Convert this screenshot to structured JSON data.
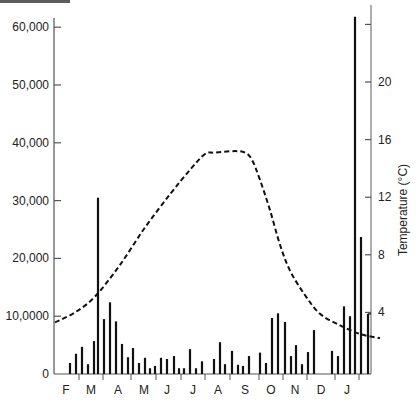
{
  "chart_data": {
    "type": "bar",
    "title": "",
    "xlabel": "",
    "ylabel": "",
    "y2label": "Temperature (°C)",
    "ylim": [
      0,
      65000
    ],
    "y2lim": [
      0,
      25
    ],
    "grid": false,
    "legend": null,
    "left_axis": {
      "ticks": [
        {
          "value": 0,
          "label": "0"
        },
        {
          "value": 10000,
          "label": "10,0000"
        },
        {
          "value": 20000,
          "label": "20,000"
        },
        {
          "value": 30000,
          "label": "30,000"
        },
        {
          "value": 40000,
          "label": "40,000"
        },
        {
          "value": 50000,
          "label": "50,000"
        },
        {
          "value": 60000,
          "label": "60,000"
        }
      ]
    },
    "right_axis": {
      "title": "Temperature (°C)",
      "ticks": [
        {
          "value": 4,
          "label": "4"
        },
        {
          "value": 8,
          "label": "8"
        },
        {
          "value": 12,
          "label": "12"
        },
        {
          "value": 16,
          "label": "16"
        },
        {
          "value": 20,
          "label": "20"
        },
        {
          "value": 24,
          "label": ""
        }
      ]
    },
    "months": [
      "F",
      "M",
      "A",
      "M",
      "J",
      "J",
      "A",
      "S",
      "O",
      "N",
      "D",
      "J"
    ],
    "series": [
      {
        "name": "Counts (bars)",
        "type": "bar",
        "x_px": [
          70,
          76,
          82,
          88,
          94,
          98,
          104,
          110,
          116,
          122,
          128,
          133,
          139,
          145,
          150,
          155,
          161,
          167,
          174,
          179,
          184,
          190,
          196,
          202,
          214,
          220,
          225,
          232,
          238,
          243,
          249,
          260,
          266,
          272,
          278,
          285,
          291,
          296,
          302,
          308,
          314,
          332,
          338,
          344,
          350,
          355,
          361,
          368
        ],
        "values": [
          1900,
          3500,
          4700,
          1700,
          5700,
          30500,
          9500,
          12400,
          9100,
          5200,
          2900,
          4500,
          1900,
          2800,
          1000,
          1400,
          2800,
          2600,
          3100,
          1000,
          1000,
          4300,
          1000,
          2200,
          2600,
          5500,
          1700,
          4000,
          1600,
          1400,
          3100,
          3700,
          1900,
          9700,
          10500,
          9000,
          3100,
          5000,
          1700,
          3800,
          7600,
          4000,
          3100,
          11700,
          10000,
          61800,
          23700,
          10400
        ]
      },
      {
        "name": "Temperature (°C)",
        "type": "line",
        "style": "dashed",
        "axis": "right",
        "x_px": [
          55,
          75,
          95,
          120,
          145,
          170,
          190,
          205,
          215,
          235,
          245,
          252,
          260,
          270,
          280,
          290,
          305,
          320,
          340,
          360,
          380
        ],
        "values": [
          3.3,
          4.0,
          5.1,
          7.3,
          9.9,
          12.2,
          13.9,
          15.0,
          15.1,
          15.2,
          15.1,
          14.6,
          13.2,
          11.1,
          8.7,
          6.9,
          5.2,
          3.9,
          3.1,
          2.5,
          2.2
        ]
      }
    ]
  }
}
